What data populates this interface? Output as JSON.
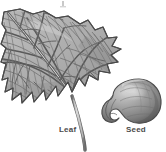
{
  "figure": {
    "type": "botanical-illustration",
    "background_color": "#ffffff",
    "style": "grayscale engraving",
    "width": 166,
    "height": 152,
    "top_artifact": {
      "visible": true,
      "color": "#c8c8c8"
    },
    "labels": {
      "leaf": "Leaf",
      "seed": "Seed",
      "color": "#4a4a4a"
    },
    "leaf": {
      "name": "leaf-illustration",
      "description": "Broad lobed leaf with reticulate vein network, serrated margin and long petiole",
      "outline_color": "#4f4f4f",
      "fill_color": "#b4b4b4",
      "vein_color": "#5a5a5a",
      "petiole_color": "#9a9a9a"
    },
    "seed": {
      "name": "seed-illustration",
      "description": "Kidney shaped seed with hilum notch and highlight",
      "outline_color": "#4a4a4a",
      "fill_color": "#8f8f8f",
      "highlight_color": "#c4c4c4",
      "shadow_color": "#5c5c5c"
    }
  }
}
